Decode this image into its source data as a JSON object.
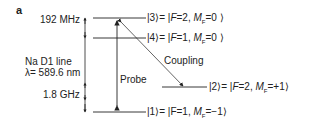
{
  "panel_label": "a",
  "splittings": {
    "upper": "192 MHz",
    "lower": "1.8 GHz"
  },
  "transition": {
    "line": "Na D1 line",
    "wavelength": "λ= 589.6 nm"
  },
  "beams": {
    "probe": "Probe",
    "coupling": "Coupling"
  },
  "levels": [
    {
      "ket": "|3⟩",
      "eq": "= |",
      "F": "F",
      "Fval": "=2, ",
      "M": "M",
      "sub": "F",
      "Mval": "=0 ⟩"
    },
    {
      "ket": "|4⟩",
      "eq": "= |",
      "F": "F",
      "Fval": "=1, ",
      "M": "M",
      "sub": "F",
      "Mval": "=0 ⟩"
    },
    {
      "ket": "|2⟩",
      "eq": "= |",
      "F": "F",
      "Fval": "=2, ",
      "M": "M",
      "sub": "F",
      "Mval": "=+1⟩"
    },
    {
      "ket": "|1⟩",
      "eq": "= |",
      "F": "F",
      "Fval": "=1, ",
      "M": "M",
      "sub": "F",
      "Mval": "=−1⟩"
    }
  ],
  "colors": {
    "ink": "#222222",
    "background": "#ffffff"
  }
}
